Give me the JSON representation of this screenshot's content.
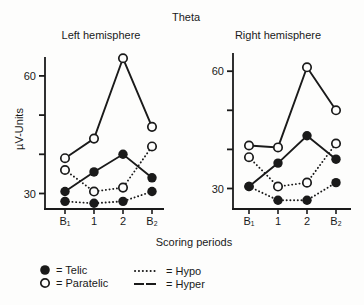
{
  "title": "Theta",
  "xlabel": "Scoring periods",
  "ylabel": "µV-Units",
  "colors": {
    "ink": "#1a1a1a",
    "background": "#fdfdfc"
  },
  "chart_data": [
    {
      "type": "line",
      "title": "Left hemisphere",
      "categories": [
        "B₁",
        "1",
        "2",
        "B₂"
      ],
      "series": [
        {
          "name": "Hyper-Paratelic",
          "line": "solid",
          "marker": "open",
          "values": [
            39,
            44,
            64.5,
            47
          ]
        },
        {
          "name": "Hyper-Telic",
          "line": "solid",
          "marker": "filled",
          "values": [
            30.5,
            35.5,
            40,
            34
          ]
        },
        {
          "name": "Hypo-Paratelic",
          "line": "dotted",
          "marker": "open",
          "values": [
            36,
            30.5,
            31.5,
            42
          ]
        },
        {
          "name": "Hypo-Telic",
          "line": "dotted",
          "marker": "filled",
          "values": [
            28,
            27.5,
            28,
            30.5
          ]
        }
      ],
      "ylabel": "µV-Units",
      "yticks": [
        30,
        40,
        50,
        60
      ],
      "ytick_labels": [
        "30",
        "",
        "",
        "60"
      ],
      "ylim": [
        26,
        65
      ],
      "grid": false
    },
    {
      "type": "line",
      "title": "Right hemisphere",
      "categories": [
        "B₁",
        "1",
        "2",
        "B₂"
      ],
      "series": [
        {
          "name": "Hyper-Paratelic",
          "line": "solid",
          "marker": "open",
          "values": [
            41,
            40.5,
            61,
            50
          ]
        },
        {
          "name": "Hyper-Telic",
          "line": "solid",
          "marker": "filled",
          "values": [
            30.5,
            36.5,
            43.5,
            37.5
          ]
        },
        {
          "name": "Hypo-Paratelic",
          "line": "dotted",
          "marker": "open",
          "values": [
            38,
            30.5,
            31.5,
            41.5
          ]
        },
        {
          "name": "Hypo-Telic",
          "line": "dotted",
          "marker": "filled",
          "values": [
            30.5,
            27,
            27,
            31.5
          ]
        }
      ],
      "ylabel": "µV-Units",
      "yticks": [
        30,
        40,
        50,
        60
      ],
      "ytick_labels": [
        "30",
        "",
        "",
        "60"
      ],
      "ylim": [
        26,
        65
      ],
      "grid": false
    }
  ],
  "legend": {
    "items": [
      {
        "symbol": "filled-circle",
        "label": "= Telic"
      },
      {
        "symbol": "open-circle",
        "label": "= Paratelic"
      },
      {
        "symbol": "dotted-line",
        "label": "= Hypo"
      },
      {
        "symbol": "solid-line",
        "label": "= Hyper"
      }
    ]
  }
}
